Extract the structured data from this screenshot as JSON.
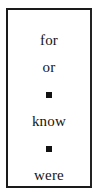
{
  "panel": {
    "border_color": "#1a1a1a",
    "background_color": "#ffffff",
    "text_color": "#151515"
  },
  "word_list": {
    "items": [
      {
        "type": "word",
        "label": "for"
      },
      {
        "type": "word",
        "label": "or"
      },
      {
        "type": "bullet",
        "label": "square-bullet"
      },
      {
        "type": "word",
        "label": "know"
      },
      {
        "type": "bullet",
        "label": "square-bullet"
      },
      {
        "type": "word",
        "label": "were"
      }
    ]
  }
}
